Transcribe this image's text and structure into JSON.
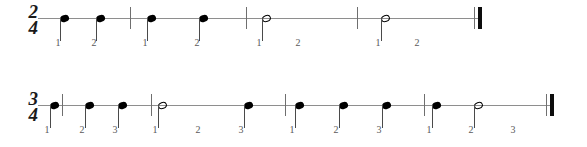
{
  "page": {
    "background_color": "#ffffff",
    "staff_line_color": "#8e8e8e",
    "note_color": "#000000",
    "beat_number_color": "#59595b",
    "barline_color": "#6f6f6f"
  },
  "systems": [
    {
      "id": "system-1",
      "time_signature": {
        "numerator": "2",
        "denominator": "4",
        "text": "2/4"
      },
      "beats_per_measure": 2,
      "line": {
        "x": 38,
        "y": 18,
        "width": 442
      },
      "timesig_pos": {
        "x": 22,
        "y": 4
      },
      "measures": [
        {
          "index": 1,
          "notes": [
            {
              "type": "quarter",
              "beat": "1",
              "duration_beats": 1,
              "x": 60,
              "label_x": 58
            },
            {
              "type": "quarter",
              "beat": "2",
              "duration_beats": 1,
              "x": 96,
              "label_x": 94
            }
          ],
          "beat_labels": [
            {
              "text": "1",
              "x": 58
            },
            {
              "text": "2",
              "x": 94
            }
          ],
          "barline_x": 130
        },
        {
          "index": 2,
          "notes": [
            {
              "type": "quarter",
              "beat": "1",
              "duration_beats": 1,
              "x": 147,
              "label_x": 145
            },
            {
              "type": "quarter",
              "beat": "2",
              "duration_beats": 1,
              "x": 199,
              "label_x": 197
            }
          ],
          "beat_labels": [
            {
              "text": "1",
              "x": 145
            },
            {
              "text": "2",
              "x": 197
            }
          ],
          "barline_x": 246
        },
        {
          "index": 3,
          "notes": [
            {
              "type": "half",
              "beat": "1",
              "duration_beats": 2,
              "x": 262,
              "label_x": 259
            }
          ],
          "beat_labels": [
            {
              "text": "1",
              "x": 259
            },
            {
              "text": "2",
              "x": 298
            }
          ],
          "barline_x": 357
        },
        {
          "index": 4,
          "notes": [
            {
              "type": "half",
              "beat": "1",
              "duration_beats": 2,
              "x": 381,
              "label_x": 378
            }
          ],
          "beat_labels": [
            {
              "text": "1",
              "x": 378
            },
            {
              "text": "2",
              "x": 417
            }
          ],
          "barline_x": null
        }
      ],
      "end_barline": {
        "x": 474,
        "y": 7,
        "height": 22,
        "style": "final-double"
      }
    },
    {
      "id": "system-2",
      "time_signature": {
        "numerator": "3",
        "denominator": "4",
        "text": "3/4"
      },
      "beats_per_measure": 3,
      "line": {
        "x": 38,
        "y": 105,
        "width": 515
      },
      "timesig_pos": {
        "x": 22,
        "y": 91
      },
      "measures": [
        {
          "index": 1,
          "notes": [
            {
              "type": "quarter",
              "beat": "1",
              "duration_beats": 1,
              "x": 50,
              "label_x": 47
            },
            {
              "type": "quarter",
              "beat": "2",
              "duration_beats": 1,
              "x": 85,
              "label_x": 82
            },
            {
              "type": "quarter",
              "beat": "3",
              "duration_beats": 1,
              "x": 118,
              "label_x": 115
            }
          ],
          "beat_labels": [
            {
              "text": "1",
              "x": 47
            },
            {
              "text": "2",
              "x": 82
            },
            {
              "text": "3",
              "x": 115
            }
          ],
          "barline_x": 151
        },
        {
          "index": 2,
          "notes": [
            {
              "type": "half",
              "beat": "1",
              "duration_beats": 2,
              "x": 158,
              "label_x": 155
            },
            {
              "type": "quarter",
              "beat": "3",
              "duration_beats": 1,
              "x": 244,
              "label_x": 241
            }
          ],
          "beat_labels": [
            {
              "text": "1",
              "x": 155
            },
            {
              "text": "2",
              "x": 198
            },
            {
              "text": "3",
              "x": 241
            }
          ],
          "barline_x": 285
        },
        {
          "index": 3,
          "notes": [
            {
              "type": "quarter",
              "beat": "1",
              "duration_beats": 1,
              "x": 295,
              "label_x": 292
            },
            {
              "type": "quarter",
              "beat": "2",
              "duration_beats": 1,
              "x": 339,
              "label_x": 336
            },
            {
              "type": "quarter",
              "beat": "3",
              "duration_beats": 1,
              "x": 382,
              "label_x": 379
            }
          ],
          "beat_labels": [
            {
              "text": "1",
              "x": 292
            },
            {
              "text": "2",
              "x": 336
            },
            {
              "text": "3",
              "x": 379
            }
          ],
          "barline_x": 424
        },
        {
          "index": 4,
          "notes": [
            {
              "type": "quarter",
              "beat": "1",
              "duration_beats": 1,
              "x": 432,
              "label_x": 429
            },
            {
              "type": "half",
              "beat": "2",
              "duration_beats": 2,
              "x": 474,
              "label_x": 471
            }
          ],
          "beat_labels": [
            {
              "text": "1",
              "x": 429
            },
            {
              "text": "2",
              "x": 471
            },
            {
              "text": "3",
              "x": 513
            }
          ],
          "barline_x": null
        },
        {
          "index": 0,
          "notes": [],
          "beat_labels": [],
          "barline_x": 62
        }
      ],
      "end_barline": {
        "x": 546,
        "y": 94,
        "height": 22,
        "style": "final-double"
      }
    }
  ]
}
